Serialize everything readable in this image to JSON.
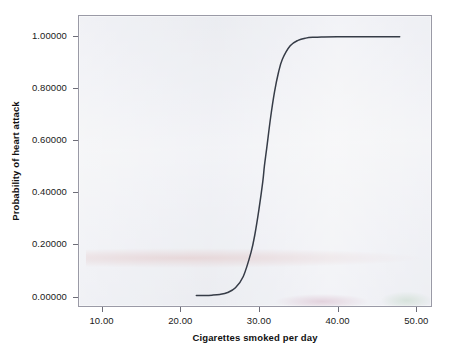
{
  "chart_data": {
    "type": "line",
    "title": "",
    "subtitle": "",
    "xlabel": "Cigarettes smoked per day",
    "ylabel": "Probability of heart attack",
    "xlim": [
      7.0,
      52.0
    ],
    "ylim": [
      -0.04,
      1.08
    ],
    "grid": false,
    "legend": null,
    "legend_position": "none",
    "x_ticks": [
      {
        "value": 10,
        "label": "10.00"
      },
      {
        "value": 20,
        "label": "20.00"
      },
      {
        "value": 30,
        "label": "30.00"
      },
      {
        "value": 40,
        "label": "40.00"
      },
      {
        "value": 50,
        "label": "50.00"
      }
    ],
    "y_ticks": [
      {
        "value": 0.0,
        "label": "0.00000"
      },
      {
        "value": 0.2,
        "label": "0.20000"
      },
      {
        "value": 0.4,
        "label": "0.40000"
      },
      {
        "value": 0.6,
        "label": "0.60000"
      },
      {
        "value": 0.8,
        "label": "0.80000"
      },
      {
        "value": 1.0,
        "label": "1.00000"
      }
    ],
    "series": [
      {
        "name": "Predicted probability",
        "type": "line",
        "color": "#363c47",
        "width": 1.5,
        "model": "logistic",
        "midpoint_x": 30.7,
        "slope": 0.95,
        "x": [
          22.0,
          23.0,
          24.0,
          25.0,
          26.0,
          27.0,
          28.0,
          29.0,
          29.5,
          30.0,
          30.5,
          30.7,
          31.0,
          31.5,
          32.0,
          32.5,
          33.0,
          34.0,
          35.0,
          36.0,
          37.0,
          38.0,
          40.0,
          42.0,
          44.0,
          46.0,
          48.0
        ],
        "y": [
          0.0003,
          0.0007,
          0.0019,
          0.0048,
          0.0122,
          0.0305,
          0.074,
          0.168,
          0.239,
          0.332,
          0.441,
          0.5,
          0.57,
          0.689,
          0.788,
          0.862,
          0.913,
          0.965,
          0.986,
          0.9945,
          0.9978,
          0.9992,
          0.9999,
          1.0,
          1.0,
          1.0,
          1.0
        ]
      }
    ],
    "annotations": [],
    "plot_background": "#e3e5ec",
    "frame_color": "#9a9aa6",
    "figure_background": "#ffffff",
    "tick_color": "#6d6d78",
    "text_color": "#1a1a1a"
  }
}
